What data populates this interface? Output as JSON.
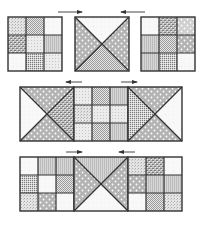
{
  "diagram": {
    "colors": {
      "line": "#333333",
      "background": "#ffffff",
      "shade": "#b8b8b8",
      "light": "#e6e6e6",
      "dot": "#ffffff"
    },
    "rows": [
      {
        "id": "row-1",
        "layout": "separate",
        "blocks": [
          {
            "type": "nine-patch",
            "x": 8,
            "y": 17,
            "size": 54,
            "cells": [
              "speckle",
              "check",
              "plain",
              "weave",
              "stipple",
              "stripe",
              "plain",
              "dense",
              "stipple"
            ]
          },
          {
            "type": "hourglass",
            "x": 75,
            "y": 17,
            "size": 54,
            "triangles": {
              "top": "plain",
              "right": "dots",
              "bottom": "check",
              "left": "dots"
            }
          },
          {
            "type": "nine-patch",
            "x": 141,
            "y": 17,
            "size": 54,
            "cells": [
              "plain",
              "weave",
              "dots-light",
              "stripe",
              "check",
              "dots",
              "stripe",
              "dense",
              "plain"
            ]
          }
        ],
        "arrows": [
          {
            "x1": 58,
            "x2": 82,
            "y": 12,
            "direction": "right"
          },
          {
            "x1": 121,
            "x2": 145,
            "y": 12,
            "direction": "left"
          }
        ]
      },
      {
        "id": "row-2",
        "layout": "joined",
        "blocks": [
          {
            "type": "hourglass",
            "x": 20,
            "y": 87,
            "size": 54,
            "triangles": {
              "top": "dots",
              "right": "weave",
              "bottom": "dots",
              "left": "plain"
            }
          },
          {
            "type": "nine-patch",
            "x": 74,
            "y": 87,
            "size": 54,
            "cells": [
              "stipple",
              "check",
              "stripe",
              "speckle",
              "stipple",
              "stipple",
              "stipple",
              "check",
              "stripe"
            ]
          },
          {
            "type": "hourglass",
            "x": 128,
            "y": 87,
            "size": 54,
            "triangles": {
              "top": "dots",
              "right": "plain",
              "bottom": "dots",
              "left": "dense"
            }
          }
        ],
        "arrows": [
          {
            "x1": 66,
            "x2": 82,
            "y": 82,
            "direction": "left"
          },
          {
            "x1": 121,
            "x2": 137,
            "y": 82,
            "direction": "right"
          }
        ]
      },
      {
        "id": "row-3",
        "layout": "joined",
        "blocks": [
          {
            "type": "nine-patch",
            "x": 20,
            "y": 157,
            "size": 54,
            "cells": [
              "plain",
              "stripe",
              "stripe",
              "dense",
              "plain",
              "check",
              "speckle",
              "dots",
              "plain"
            ]
          },
          {
            "type": "hourglass",
            "x": 74,
            "y": 157,
            "size": 54,
            "triangles": {
              "top": "stripe",
              "right": "dots",
              "bottom": "plain",
              "left": "dots"
            }
          },
          {
            "type": "nine-patch",
            "x": 128,
            "y": 157,
            "size": 54,
            "cells": [
              "speckle",
              "weave",
              "plain",
              "dots",
              "stripe",
              "stripe",
              "plain",
              "check",
              "speckle"
            ]
          }
        ],
        "arrows": [
          {
            "x1": 66,
            "x2": 82,
            "y": 152,
            "direction": "right"
          },
          {
            "x1": 119,
            "x2": 135,
            "y": 152,
            "direction": "left"
          }
        ]
      }
    ]
  }
}
